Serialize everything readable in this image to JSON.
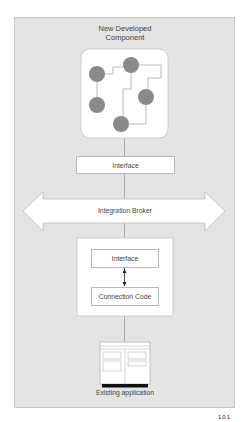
{
  "diagram": {
    "title_line1": "New Developed",
    "title_line2": "Component",
    "top_interface_label": "Interface",
    "broker_label": "Integration Broker",
    "inner_interface_label": "Interface",
    "connection_code_label": "Connection Code",
    "existing_app_label": "Existing application",
    "component_nodes": [
      {
        "id": "n1",
        "cx": 97,
        "cy": 74
      },
      {
        "id": "n2",
        "cx": 131,
        "cy": 65
      },
      {
        "id": "n3",
        "cx": 97,
        "cy": 105
      },
      {
        "id": "n4",
        "cx": 146,
        "cy": 97
      },
      {
        "id": "n5",
        "cx": 121,
        "cy": 124
      }
    ],
    "colors": {
      "panel": "#e4e4e4",
      "node": "#8a8a8a",
      "line": "#9a9a9a",
      "box_border": "#b9b9b9",
      "text": "#444444"
    }
  },
  "footer": {
    "page_fragment": "101"
  }
}
